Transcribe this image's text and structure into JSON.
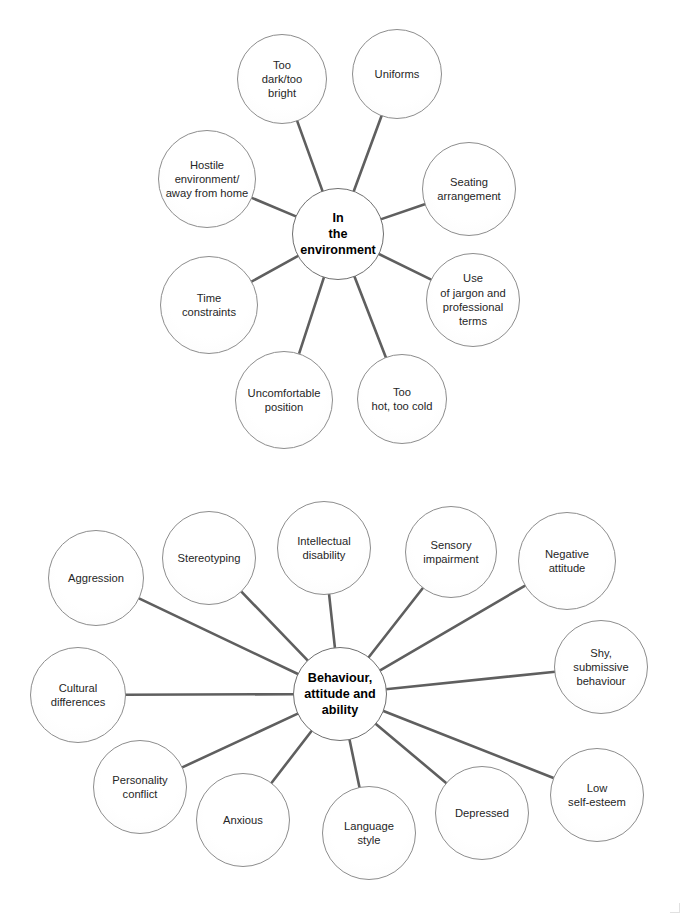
{
  "document": {
    "title": "Barriers to communication mind maps",
    "background_color": "#ffffff",
    "node_stroke_color": "#8d8d8d",
    "edge_color": "#5f5f5f",
    "text_color": "#262626"
  },
  "diagrams": [
    {
      "id": "environment",
      "center": {
        "label": "In\nthe\nenvironment",
        "cx": 338,
        "cy": 234,
        "r": 46
      },
      "satellites": [
        {
          "label": "Too\ndark/too\nbright",
          "cx": 282,
          "cy": 79,
          "r": 45
        },
        {
          "label": "Uniforms",
          "cx": 397,
          "cy": 74,
          "r": 45
        },
        {
          "label": "Seating\narrangement",
          "cx": 469,
          "cy": 189,
          "r": 47
        },
        {
          "label": "Use\nof jargon and\nprofessional\nterms",
          "cx": 473,
          "cy": 300,
          "r": 47
        },
        {
          "label": "Too\nhot, too cold",
          "cx": 402,
          "cy": 399,
          "r": 45
        },
        {
          "label": "Uncomfortable\nposition",
          "cx": 284,
          "cy": 400,
          "r": 49
        },
        {
          "label": "Time\nconstraints",
          "cx": 209,
          "cy": 305,
          "r": 49
        },
        {
          "label": "Hostile\nenvironment/\naway from home",
          "cx": 207,
          "cy": 179,
          "r": 49
        }
      ]
    },
    {
      "id": "behaviour",
      "center": {
        "label": "Behaviour,\nattitude and\nability",
        "cx": 340,
        "cy": 694,
        "r": 47
      },
      "satellites": [
        {
          "label": "Aggression",
          "cx": 96,
          "cy": 578,
          "r": 48
        },
        {
          "label": "Stereotyping",
          "cx": 209,
          "cy": 558,
          "r": 47
        },
        {
          "label": "Intellectual\ndisability",
          "cx": 324,
          "cy": 548,
          "r": 47
        },
        {
          "label": "Sensory\nimpairment",
          "cx": 451,
          "cy": 552,
          "r": 46
        },
        {
          "label": "Negative\nattitude",
          "cx": 567,
          "cy": 561,
          "r": 49
        },
        {
          "label": "Shy,\nsubmissive\nbehaviour",
          "cx": 601,
          "cy": 667,
          "r": 47
        },
        {
          "label": "Low\nself-esteem",
          "cx": 597,
          "cy": 795,
          "r": 47
        },
        {
          "label": "Depressed",
          "cx": 482,
          "cy": 813,
          "r": 47
        },
        {
          "label": "Language\nstyle",
          "cx": 369,
          "cy": 833,
          "r": 47
        },
        {
          "label": "Anxious",
          "cx": 243,
          "cy": 820,
          "r": 47
        },
        {
          "label": "Personality\nconflict",
          "cx": 140,
          "cy": 787,
          "r": 47
        },
        {
          "label": "Cultural\ndifferences",
          "cx": 78,
          "cy": 695,
          "r": 48
        }
      ]
    }
  ]
}
